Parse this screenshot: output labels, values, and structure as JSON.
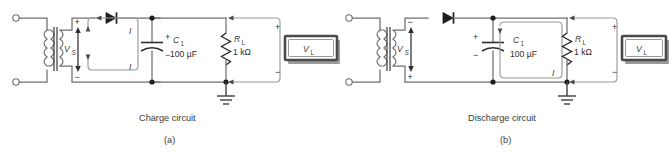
{
  "figure": {
    "background_color": "#ffffff",
    "wire_color": "#6f6f6f",
    "label_color": "#3d3d3d"
  },
  "circuits": [
    {
      "id": "a",
      "caption": "Charge circuit",
      "sub_caption": "(a)",
      "source_label": "V",
      "source_sub": "S",
      "source_polarity_top": "+",
      "source_polarity_bottom": "−",
      "diode_name": "diode",
      "capacitor_label": "C",
      "capacitor_sub": "1",
      "capacitor_value": "100 µF",
      "capacitor_polarity_top": "+",
      "capacitor_polarity_bottom": "−",
      "resistor_label": "R",
      "resistor_sub": "L",
      "resistor_value": "1 kΩ",
      "load_label": "V",
      "load_sub": "L",
      "load_polarity_top": "+",
      "load_polarity_bottom": "−",
      "current_label_top": "I",
      "current_label_bottom": "I",
      "loop_position": "source-to-capacitor",
      "ground": "earth-ground"
    },
    {
      "id": "b",
      "caption": "Discharge circuit",
      "sub_caption": "(b)",
      "source_label": "V",
      "source_sub": "S",
      "source_polarity_top": "−",
      "source_polarity_bottom": "+",
      "diode_name": "diode",
      "capacitor_label": "C",
      "capacitor_sub": "1",
      "capacitor_value": "100 µF",
      "capacitor_polarity_top": "+",
      "capacitor_polarity_bottom": "−",
      "resistor_label": "R",
      "resistor_sub": "L",
      "resistor_value": "1 kΩ",
      "load_label": "V",
      "load_sub": "L",
      "load_polarity_top": "+",
      "load_polarity_bottom": "−",
      "current_label_top": "",
      "current_label_bottom": "I",
      "loop_position": "capacitor-to-load",
      "ground": "earth-ground"
    }
  ]
}
